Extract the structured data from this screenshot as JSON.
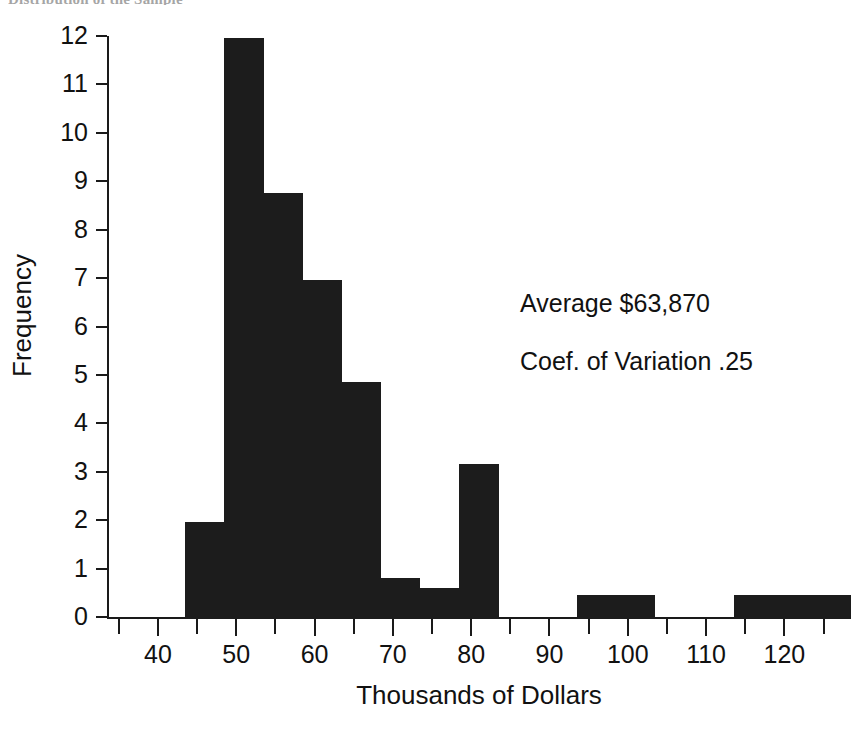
{
  "figure": {
    "top_clipped_text": "Distribution of the Sample",
    "background_color": "#ffffff",
    "ink_color": "#1c1c1c"
  },
  "annotations": [
    {
      "name": "average-annotation",
      "text": "Average $63,870"
    },
    {
      "name": "coef-variation-annotation",
      "text": "Coef. of Variation .25"
    }
  ],
  "chart_data": {
    "type": "bar",
    "title": "",
    "xlabel": "Thousands of Dollars",
    "ylabel": "Frequency",
    "xlim": [
      33.5,
      128.5
    ],
    "ylim": [
      0,
      12
    ],
    "grid": false,
    "legend": "none",
    "bar_color": "#1c1c1c",
    "x_major_ticks": [
      40,
      50,
      60,
      70,
      80,
      90,
      100,
      110,
      120
    ],
    "x_minor_ticks": [
      35,
      45,
      55,
      65,
      75,
      85,
      95,
      105,
      115,
      125
    ],
    "x_tick_labels": [
      "40",
      "50",
      "60",
      "70",
      "80",
      "90",
      "100",
      "110",
      "120"
    ],
    "y_ticks": [
      0,
      1,
      2,
      3,
      4,
      5,
      6,
      7,
      8,
      9,
      10,
      11,
      12
    ],
    "y_tick_labels": [
      "0",
      "1",
      "2",
      "3",
      "4",
      "5",
      "6",
      "7",
      "8",
      "9",
      "10",
      "11",
      "12"
    ],
    "bins": [
      {
        "start": 43.5,
        "end": 48.5,
        "value": 2.0
      },
      {
        "start": 48.5,
        "end": 53.5,
        "value": 12.0
      },
      {
        "start": 53.5,
        "end": 58.5,
        "value": 8.8
      },
      {
        "start": 58.5,
        "end": 63.5,
        "value": 7.0
      },
      {
        "start": 63.5,
        "end": 68.5,
        "value": 4.9
      },
      {
        "start": 68.5,
        "end": 73.5,
        "value": 0.85
      },
      {
        "start": 73.5,
        "end": 78.5,
        "value": 0.65
      },
      {
        "start": 78.5,
        "end": 83.5,
        "value": 3.2
      },
      {
        "start": 93.5,
        "end": 103.5,
        "value": 0.5
      },
      {
        "start": 113.5,
        "end": 128.5,
        "value": 0.5
      }
    ],
    "categories": [
      "43.5-48.5",
      "48.5-53.5",
      "53.5-58.5",
      "58.5-63.5",
      "63.5-68.5",
      "68.5-73.5",
      "73.5-78.5",
      "78.5-83.5",
      "93.5-103.5",
      "113.5-128.5"
    ],
    "values": [
      2.0,
      12.0,
      8.8,
      7.0,
      4.9,
      0.85,
      0.65,
      3.2,
      0.5,
      0.5
    ]
  }
}
